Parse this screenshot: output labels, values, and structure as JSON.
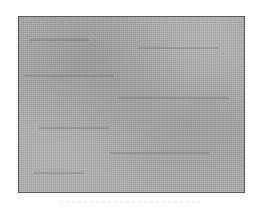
{
  "image": {
    "kind": "grainy-gray-texture",
    "colors": {
      "background": "#ffffff",
      "panel_fill": "#a9a9a9",
      "panel_border": "#5a5a5a"
    },
    "panel": {
      "x": 18,
      "y": 16,
      "width": 227,
      "height": 177
    }
  }
}
